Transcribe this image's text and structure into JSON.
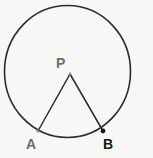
{
  "figure": {
    "background_color": "#f7f7f5",
    "stroke_color": "#2b2b2b",
    "circle": {
      "name": "circle-outline",
      "center_x": 67.5,
      "center_y": 71.5,
      "radius_x": 63.0,
      "radius_y": 66.0,
      "stroke_width": 1.6,
      "fill": "none"
    },
    "points": [
      {
        "id": "P",
        "label": "P",
        "x": 70.0,
        "y": 74.0,
        "label_x": 56,
        "label_y": 56,
        "label_color": "#6f6f6f",
        "marker": "small-dot",
        "marker_color": "#8a8a8a",
        "marker_radius": 1.4
      },
      {
        "id": "A",
        "label": "A",
        "x": 38.0,
        "y": 131.0,
        "label_x": 26,
        "label_y": 137,
        "label_color": "#6b6b6b",
        "marker": "small-dot",
        "marker_color": "#8a8a8a",
        "marker_radius": 1.6
      },
      {
        "id": "B",
        "label": "B",
        "x": 103.0,
        "y": 131.0,
        "label_x": 103,
        "label_y": 137,
        "label_color": "#181818",
        "marker": "dot",
        "marker_color": "#1c1c1c",
        "marker_radius": 2.4
      }
    ],
    "segments": [
      {
        "name": "segment-PA",
        "from": "P",
        "to": "A",
        "x1": 70.0,
        "y1": 74.0,
        "x2": 38.0,
        "y2": 131.0,
        "stroke_width": 1.5,
        "color": "#2b2b2b"
      },
      {
        "name": "segment-PB",
        "from": "P",
        "to": "B",
        "x1": 70.0,
        "y1": 74.0,
        "x2": 103.0,
        "y2": 131.0,
        "stroke_width": 1.5,
        "color": "#2b2b2b"
      }
    ],
    "labels": {
      "P": "P",
      "A": "A",
      "B": "B"
    }
  }
}
